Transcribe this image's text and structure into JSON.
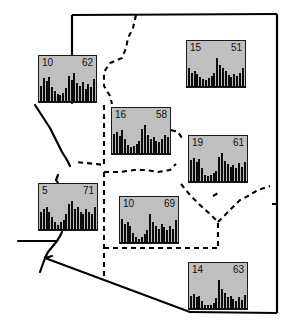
{
  "figure": {
    "width": 290,
    "height": 329,
    "background_color": "#ffffff",
    "panel_fill_color": "#bfbfbf",
    "panel_border_color": "#1a1a1a",
    "bar_color": "#0d0d0d",
    "state_outline_color": "#000000",
    "dashed_boundary_color": "#000000"
  },
  "chart_data": [
    {
      "id": "panel-nw",
      "type": "bar",
      "title": "",
      "min_label": "10",
      "max_label": "62",
      "ylim": [
        10,
        62
      ],
      "xlabel": "",
      "ylabel": "",
      "grid": false,
      "legend": "none",
      "categories": [
        "1",
        "2",
        "3",
        "4",
        "5",
        "6",
        "7",
        "8",
        "9",
        "10",
        "11",
        "12",
        "13",
        "14",
        "15",
        "16",
        "17",
        "18",
        "19",
        "20"
      ],
      "values": [
        30,
        44,
        38,
        46,
        28,
        20,
        14,
        12,
        16,
        26,
        48,
        40,
        52,
        34,
        30,
        36,
        24,
        32,
        28,
        42
      ]
    },
    {
      "id": "panel-ne",
      "type": "bar",
      "title": "",
      "min_label": "15",
      "max_label": "51",
      "ylim": [
        15,
        51
      ],
      "xlabel": "",
      "ylabel": "",
      "grid": false,
      "legend": "none",
      "categories": [
        "1",
        "2",
        "3",
        "4",
        "5",
        "6",
        "7",
        "8",
        "9",
        "10",
        "11",
        "12",
        "13",
        "14",
        "15",
        "16",
        "17",
        "18",
        "19",
        "20"
      ],
      "values": [
        34,
        26,
        30,
        24,
        18,
        14,
        12,
        16,
        20,
        26,
        52,
        40,
        34,
        30,
        22,
        18,
        24,
        20,
        26,
        34
      ]
    },
    {
      "id": "panel-central-north",
      "type": "bar",
      "title": "",
      "min_label": "16",
      "max_label": "58",
      "ylim": [
        16,
        58
      ],
      "xlabel": "",
      "ylabel": "",
      "grid": false,
      "legend": "none",
      "categories": [
        "1",
        "2",
        "3",
        "4",
        "5",
        "6",
        "7",
        "8",
        "9",
        "10",
        "11",
        "12",
        "13",
        "14",
        "15",
        "16",
        "17",
        "18",
        "19",
        "20"
      ],
      "values": [
        40,
        44,
        36,
        48,
        30,
        18,
        14,
        16,
        20,
        26,
        50,
        56,
        38,
        30,
        34,
        26,
        24,
        30,
        38,
        34
      ]
    },
    {
      "id": "panel-east",
      "type": "bar",
      "title": "",
      "min_label": "19",
      "max_label": "61",
      "ylim": [
        19,
        61
      ],
      "xlabel": "",
      "ylabel": "",
      "grid": false,
      "legend": "none",
      "categories": [
        "1",
        "2",
        "3",
        "4",
        "5",
        "6",
        "7",
        "8",
        "9",
        "10",
        "11",
        "12",
        "13",
        "14",
        "15",
        "16",
        "17",
        "18",
        "19",
        "20"
      ],
      "values": [
        44,
        48,
        40,
        46,
        28,
        14,
        12,
        14,
        18,
        22,
        50,
        56,
        42,
        36,
        30,
        34,
        28,
        38,
        30,
        40
      ]
    },
    {
      "id": "panel-west",
      "type": "bar",
      "title": "",
      "min_label": "5",
      "max_label": "71",
      "ylim": [
        5,
        71
      ],
      "xlabel": "",
      "ylabel": "",
      "grid": false,
      "legend": "none",
      "categories": [
        "1",
        "2",
        "3",
        "4",
        "5",
        "6",
        "7",
        "8",
        "9",
        "10",
        "11",
        "12",
        "13",
        "14",
        "15",
        "16",
        "17",
        "18",
        "19",
        "20"
      ],
      "values": [
        14,
        16,
        18,
        14,
        10,
        6,
        4,
        6,
        8,
        12,
        20,
        22,
        16,
        18,
        14,
        12,
        16,
        14,
        12,
        18
      ]
    },
    {
      "id": "panel-central-south",
      "type": "bar",
      "title": "",
      "min_label": "10",
      "max_label": "69",
      "ylim": [
        10,
        69
      ],
      "xlabel": "",
      "ylabel": "",
      "grid": false,
      "legend": "none",
      "categories": [
        "1",
        "2",
        "3",
        "4",
        "5",
        "6",
        "7",
        "8",
        "9",
        "10",
        "11",
        "12",
        "13",
        "14",
        "15",
        "16",
        "17",
        "18",
        "19",
        "20"
      ],
      "values": [
        34,
        26,
        30,
        24,
        14,
        8,
        6,
        8,
        12,
        18,
        40,
        30,
        24,
        20,
        26,
        22,
        18,
        24,
        20,
        32
      ]
    },
    {
      "id": "panel-se",
      "type": "bar",
      "title": "",
      "min_label": "14",
      "max_label": "63",
      "ylim": [
        14,
        63
      ],
      "xlabel": "",
      "ylabel": "",
      "grid": false,
      "legend": "none",
      "categories": [
        "1",
        "2",
        "3",
        "4",
        "5",
        "6",
        "7",
        "8",
        "9",
        "10",
        "11",
        "12",
        "13",
        "14",
        "15",
        "16",
        "17",
        "18",
        "19",
        "20"
      ],
      "values": [
        30,
        34,
        26,
        30,
        18,
        10,
        8,
        10,
        14,
        24,
        64,
        44,
        36,
        26,
        30,
        22,
        18,
        26,
        20,
        32
      ]
    }
  ],
  "panels": [
    {
      "name": "panel-nw",
      "min": "10",
      "max": "62",
      "x": 38,
      "y": 55,
      "w": 59,
      "h": 48
    },
    {
      "name": "panel-ne",
      "min": "15",
      "max": "51",
      "x": 186,
      "y": 40,
      "w": 60,
      "h": 48
    },
    {
      "name": "panel-central-north",
      "min": "16",
      "max": "58",
      "x": 111,
      "y": 107,
      "w": 60,
      "h": 48
    },
    {
      "name": "panel-east",
      "min": "19",
      "max": "61",
      "x": 188,
      "y": 135,
      "w": 60,
      "h": 48
    },
    {
      "name": "panel-west",
      "min": "5",
      "max": "71",
      "x": 38,
      "y": 183,
      "w": 60,
      "h": 48
    },
    {
      "name": "panel-central-south",
      "min": "10",
      "max": "69",
      "x": 119,
      "y": 196,
      "w": 60,
      "h": 48
    },
    {
      "name": "panel-se",
      "min": "14",
      "max": "63",
      "x": 188,
      "y": 262,
      "w": 60,
      "h": 48
    }
  ]
}
